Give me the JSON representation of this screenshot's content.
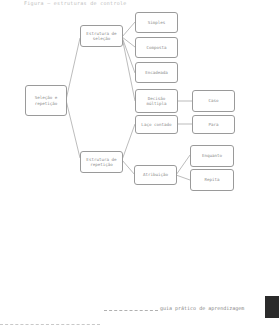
{
  "caption": "Figura — estruturas de controle",
  "diagram": {
    "root": "Seleção e repetição",
    "selection": {
      "label": "Estrutura de seleção",
      "children": [
        "Simples",
        "Composta",
        "Encadeada",
        "Decisão múltipla"
      ],
      "multiple_decision_child": "Caso"
    },
    "repetition": {
      "label": "Estrutura de repetição",
      "counted_loop": "Laço contado",
      "counted_loop_child": "Para",
      "conditional": "Atribuição",
      "conditional_children": [
        "Enquanto",
        "Repita"
      ]
    }
  },
  "footer": {
    "text": "guia prático de aprendizagem"
  }
}
